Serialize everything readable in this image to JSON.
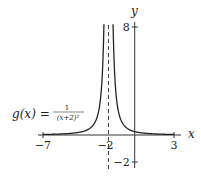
{
  "chart_data": {
    "type": "line",
    "title": "",
    "function_label": {
      "lhs": "g(x) =",
      "numerator": "1",
      "denominator": "(x+2)²"
    },
    "xlabel": "x",
    "ylabel": "y",
    "xlim": [
      -7,
      3
    ],
    "ylim": [
      -2,
      8
    ],
    "x_ticks": [
      {
        "value": -7,
        "label": "−7"
      },
      {
        "value": -2,
        "label": "−2"
      },
      {
        "value": 3,
        "label": "3"
      }
    ],
    "y_ticks": [
      {
        "value": 8,
        "label": "8"
      },
      {
        "value": -2,
        "label": "−2"
      }
    ],
    "vertical_asymptote": {
      "x": -2,
      "style": "dashed"
    },
    "horizontal_asymptote": {
      "y": 0
    },
    "grid": false,
    "series": [
      {
        "name": "g(x) = 1/(x+2)^2",
        "x": [
          -7,
          -6,
          -5,
          -4,
          -3.5,
          -3,
          -2.75,
          -2.5,
          -2.4,
          -2.35,
          -1.65,
          -1.6,
          -1.5,
          -1.25,
          -1,
          -0.5,
          0,
          1,
          2,
          3
        ],
        "values": [
          0.04,
          0.0625,
          0.111,
          0.25,
          0.444,
          1,
          1.778,
          4,
          6.25,
          8.16,
          8.16,
          6.25,
          4,
          1.778,
          1,
          0.444,
          0.25,
          0.111,
          0.0625,
          0.04
        ]
      }
    ],
    "colors": {
      "curve": "#222222",
      "axes": "#333333",
      "asymptote": "#444444"
    }
  }
}
